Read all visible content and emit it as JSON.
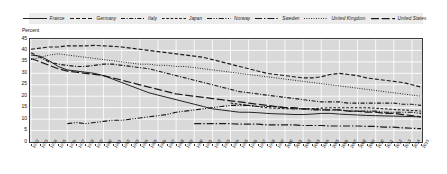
{
  "chart_data": {
    "type": "line",
    "title": "",
    "xlabel": "",
    "ylabel": "Percent",
    "ylim": [
      0,
      45
    ],
    "yticks": [
      0,
      5,
      10,
      15,
      20,
      25,
      30,
      35,
      40,
      45
    ],
    "grid": true,
    "legend_position": "top",
    "x": [
      1972,
      1973,
      1974,
      1975,
      1976,
      1977,
      1978,
      1979,
      1980,
      1981,
      1982,
      1983,
      1984,
      1985,
      1986,
      1987,
      1988,
      1989,
      1990,
      1991,
      1992,
      1993,
      1994,
      1995,
      1996,
      1997,
      1998,
      1999,
      2000,
      2001,
      2002,
      2003,
      2004,
      2005,
      2006,
      2007,
      2008,
      2009,
      2010,
      2011,
      2012,
      2013,
      2014,
      2015
    ],
    "categories": [
      "1972",
      "1973",
      "1974",
      "1975",
      "1976",
      "1977",
      "1978",
      "1979",
      "1980",
      "1981",
      "1982",
      "1983",
      "1984",
      "1985",
      "1986",
      "1987",
      "1988",
      "1989",
      "1990",
      "1991",
      "1992",
      "1993",
      "1994",
      "1995",
      "1996",
      "1997",
      "1998",
      "1999",
      "2000",
      "2001",
      "2002",
      "2003",
      "2004",
      "2005",
      "2006",
      "2007",
      "2008",
      "2009",
      "2010",
      "2011",
      "2012",
      "2013",
      "2014",
      "2015"
    ],
    "series": [
      {
        "name": "France",
        "style": "solid",
        "color": "#1a1a1a",
        "values": [
          38.0,
          37.5,
          35.5,
          33.0,
          31.5,
          31.0,
          30.5,
          30.0,
          29.0,
          27.5,
          26.0,
          24.5,
          23.0,
          21.5,
          20.5,
          19.5,
          18.5,
          17.5,
          16.5,
          15.5,
          14.5,
          14.0,
          13.5,
          13.0,
          13.0,
          12.8,
          12.5,
          12.3,
          12.2,
          12.0,
          12.0,
          12.2,
          12.5,
          12.5,
          12.2,
          12.0,
          11.8,
          11.6,
          11.5,
          11.4,
          11.3,
          11.2,
          11.1,
          11.0
        ]
      },
      {
        "name": "Germany",
        "style": "dashed",
        "color": "#1a1a1a",
        "values": [
          40.5,
          41.0,
          41.5,
          41.5,
          42.0,
          42.0,
          42.0,
          42.2,
          42.0,
          41.8,
          41.5,
          41.0,
          40.5,
          40.0,
          39.5,
          39.0,
          38.5,
          38.0,
          37.5,
          37.0,
          36.0,
          35.0,
          34.0,
          33.0,
          32.0,
          31.0,
          30.0,
          29.5,
          29.0,
          28.5,
          28.0,
          28.0,
          28.5,
          29.5,
          30.0,
          29.5,
          29.0,
          28.0,
          27.5,
          27.0,
          26.5,
          26.0,
          25.0,
          24.0
        ]
      },
      {
        "name": "Italy",
        "style": "dashdot",
        "color": "#1a1a1a",
        "values": [
          39.0,
          37.0,
          35.0,
          34.0,
          33.5,
          33.0,
          33.0,
          33.5,
          34.0,
          34.0,
          33.5,
          33.0,
          32.5,
          32.0,
          31.0,
          30.0,
          29.0,
          28.0,
          27.0,
          26.0,
          25.0,
          24.0,
          23.0,
          22.0,
          21.5,
          21.0,
          20.5,
          20.0,
          19.5,
          19.0,
          18.5,
          18.0,
          17.5,
          17.5,
          17.5,
          17.0,
          17.0,
          17.0,
          17.0,
          17.0,
          17.0,
          16.5,
          16.5,
          16.0
        ]
      },
      {
        "name": "Japan",
        "style": "dashed-small",
        "color": "#1a1a1a",
        "values": [
          null,
          null,
          null,
          null,
          null,
          null,
          null,
          null,
          null,
          null,
          null,
          null,
          null,
          null,
          null,
          null,
          null,
          null,
          null,
          null,
          null,
          null,
          null,
          null,
          null,
          null,
          null,
          null,
          null,
          null,
          null,
          null,
          null,
          null,
          null,
          null,
          null,
          null,
          null,
          null,
          null,
          null,
          null,
          null
        ]
      },
      {
        "name": "Norway",
        "style": "dashdotdot",
        "color": "#1a1a1a",
        "values": [
          null,
          null,
          null,
          null,
          8.0,
          8.5,
          8.0,
          8.5,
          9.0,
          9.5,
          9.5,
          10.0,
          10.5,
          11.0,
          11.5,
          12.0,
          13.0,
          13.5,
          14.0,
          14.5,
          15.0,
          15.5,
          16.0,
          16.0,
          16.0,
          15.5,
          15.5,
          15.5,
          15.0,
          14.5,
          14.5,
          14.0,
          14.0,
          14.0,
          14.0,
          13.5,
          13.5,
          13.5,
          13.5,
          13.0,
          13.0,
          13.0,
          13.0,
          12.5
        ]
      },
      {
        "name": "Sweden",
        "style": "dashdot-long",
        "color": "#1a1a1a",
        "values": [
          null,
          null,
          null,
          null,
          null,
          null,
          null,
          null,
          null,
          null,
          null,
          null,
          null,
          null,
          null,
          null,
          null,
          null,
          8.0,
          8.0,
          8.0,
          8.0,
          8.0,
          7.8,
          7.8,
          7.8,
          7.5,
          7.5,
          7.5,
          7.5,
          7.2,
          7.2,
          7.2,
          7.0,
          7.0,
          7.0,
          7.0,
          6.8,
          6.8,
          6.5,
          6.5,
          6.2,
          6.0,
          5.8
        ]
      },
      {
        "name": "United Kingdom",
        "style": "dotted",
        "color": "#1a1a1a",
        "values": [
          36.0,
          37.0,
          38.0,
          38.5,
          38.0,
          37.5,
          37.0,
          36.5,
          36.0,
          35.5,
          35.0,
          34.5,
          34.0,
          34.0,
          33.5,
          33.5,
          33.0,
          33.0,
          32.5,
          32.0,
          31.5,
          31.0,
          30.5,
          30.0,
          29.5,
          29.0,
          28.5,
          28.0,
          27.5,
          27.0,
          26.5,
          26.0,
          25.5,
          25.0,
          24.5,
          24.0,
          23.5,
          23.0,
          22.5,
          22.0,
          21.5,
          21.0,
          20.5,
          20.0
        ]
      },
      {
        "name": "United States",
        "style": "longdash",
        "color": "#1a1a1a",
        "values": [
          36.5,
          35.0,
          33.5,
          32.0,
          31.0,
          30.5,
          30.0,
          29.5,
          29.0,
          28.0,
          27.0,
          26.0,
          25.0,
          24.0,
          23.0,
          22.0,
          21.0,
          20.5,
          20.0,
          19.5,
          19.0,
          18.5,
          18.0,
          17.5,
          17.0,
          16.5,
          16.0,
          15.5,
          15.0,
          15.0,
          14.5,
          14.5,
          14.0,
          14.0,
          14.0,
          13.5,
          13.5,
          13.0,
          13.0,
          12.5,
          12.5,
          12.0,
          11.5,
          11.0
        ]
      }
    ],
    "series_japan_note": "Japan series shown as small-dash line, overlapping mid-range values",
    "japan_values": [
      null,
      null,
      null,
      null,
      null,
      null,
      null,
      null,
      null,
      null,
      null,
      null,
      null,
      null,
      null,
      null,
      null,
      null,
      null,
      null,
      null,
      null,
      17.0,
      16.5,
      16.0,
      15.5,
      15.0,
      14.8,
      14.5,
      14.5,
      14.5,
      14.5,
      14.8,
      15.0,
      15.0,
      15.0,
      15.0,
      15.0,
      14.8,
      14.5,
      14.2,
      14.0,
      13.8,
      13.5
    ]
  },
  "axis": {
    "ylabel": "Percent",
    "yticks": [
      "0",
      "5",
      "10",
      "15",
      "20",
      "25",
      "30",
      "35",
      "40",
      "45"
    ]
  },
  "legend": {
    "items": [
      {
        "label": "France",
        "style": "solid"
      },
      {
        "label": "Germany",
        "style": "dashed"
      },
      {
        "label": "Italy",
        "style": "dashdot"
      },
      {
        "label": "Japan",
        "style": "dashed-small"
      },
      {
        "label": "Norway",
        "style": "dashdotdot"
      },
      {
        "label": "Sweden",
        "style": "dashdot-long"
      },
      {
        "label": "United Kingdom",
        "style": "dotted"
      },
      {
        "label": "United States",
        "style": "longdash"
      }
    ]
  },
  "style": {
    "plot_bg": "#d9d9d9",
    "grid_color": "#ffffff",
    "line_color": "#1a1a1a",
    "legend_bg": "#ececec",
    "frame_color": "#3a3a3a"
  }
}
